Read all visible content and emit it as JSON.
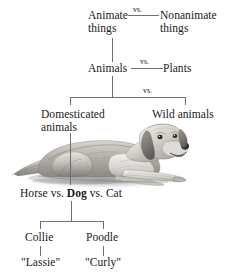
{
  "diagram": {
    "type": "tree-hierarchy",
    "line_color": "#6d6f73",
    "text_color": "#18181a",
    "background": "#ffffff"
  },
  "levels": {
    "level1": {
      "left": {
        "line1": "Animate",
        "line2": "things"
      },
      "contrast": "vs.",
      "right": {
        "line1": "Nonanimate",
        "line2": "things"
      }
    },
    "level2": {
      "left": "Animals",
      "contrast": "vs.",
      "right": "Plants"
    },
    "level3": {
      "left": {
        "line1": "Domesticated",
        "line2": "animals"
      },
      "contrast": "vs.",
      "right": "Wild animals"
    },
    "level4": {
      "part1": "Horse vs. ",
      "highlight": "Dog",
      "part2": " vs. Cat"
    },
    "level5": {
      "left": "Collie",
      "right": "Poodle"
    },
    "level6": {
      "left": "\"Lassie\"",
      "right": "\"Curly\""
    }
  },
  "illustration": {
    "name": "golden-retriever-lying-down",
    "alt": "Grayscale drawing of a golden retriever lying down"
  }
}
